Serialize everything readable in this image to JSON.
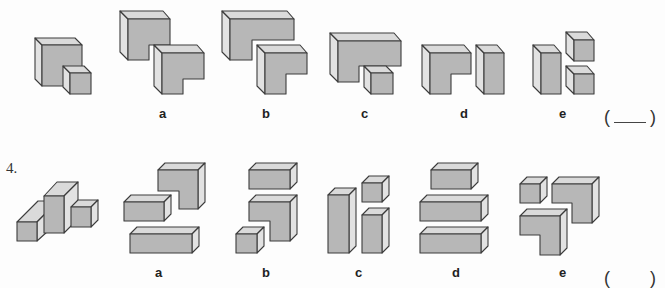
{
  "questions": [
    {
      "number": "",
      "target": "L-shaped block with small cube in notch",
      "options": [
        {
          "label": "a",
          "description": "two L-shaped blocks"
        },
        {
          "label": "b",
          "description": "large L-shaped block and L-shaped block"
        },
        {
          "label": "c",
          "description": "wide L-shaped block and small cube"
        },
        {
          "label": "d",
          "description": "L-shaped block and tall rectangular block"
        },
        {
          "label": "e",
          "description": "tall rectangular block and two small cubes"
        }
      ],
      "answer_placeholder": "( ____ )"
    },
    {
      "number": "4.",
      "target": "composite block: tall center column with side blocks",
      "options": [
        {
          "label": "a",
          "description": "L-shaped block, short bar, long bar"
        },
        {
          "label": "b",
          "description": "bar, L-shaped block, small cube"
        },
        {
          "label": "c",
          "description": "tall column, small cube, medium column"
        },
        {
          "label": "d",
          "description": "short bar and two long bars"
        },
        {
          "label": "e",
          "description": "small cube and two L-shaped blocks"
        }
      ],
      "answer_placeholder": "(    )"
    }
  ],
  "labels": {
    "q3": {
      "a": "a",
      "b": "b",
      "c": "c",
      "d": "d",
      "e": "e"
    },
    "q4": {
      "num": "4.",
      "a": "a",
      "b": "b",
      "c": "c",
      "d": "d",
      "e": "e"
    },
    "answer_open": "(",
    "answer_close": ")"
  },
  "colors": {
    "front_face": "#b7b7b7",
    "top_face": "#dadada",
    "side_face": "#e2e2e2",
    "outline": "#3c3c3c"
  }
}
